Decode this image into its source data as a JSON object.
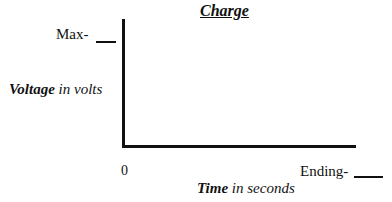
{
  "chart_data": {
    "type": "line",
    "title": "Charge",
    "xlabel": "Time in seconds",
    "ylabel": "Voltage in volts",
    "x_ticks": [
      "0",
      "Ending-"
    ],
    "y_ticks": [
      "Max-"
    ],
    "series": [],
    "grid": false,
    "note": "Blank axes template; fill-in blanks for Max voltage and Ending time"
  },
  "title": "Charge",
  "y_axis": {
    "label_bold": "Voltage",
    "label_rest": " in volts",
    "max_label": "Max-"
  },
  "x_axis": {
    "label_bold": "Time",
    "label_rest": " in seconds",
    "origin_label": "0",
    "end_label": "Ending-"
  }
}
